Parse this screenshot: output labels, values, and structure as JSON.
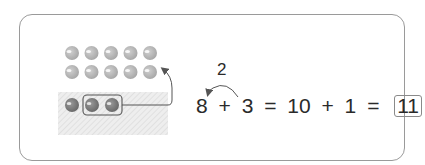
{
  "diagram": {
    "ten_frame": {
      "rows": 2,
      "columns": 5,
      "ball_count": 10,
      "ball_color": "#b4b4b4"
    },
    "extra_row": {
      "ball_count": 3,
      "grouped_ball_count": 2,
      "ball_color": "#7a7a7a"
    },
    "equation": {
      "term1": "8",
      "op1": "+",
      "term2": "3",
      "eq1": "=",
      "term3": "10",
      "op2": "+",
      "term4": "1",
      "eq2": "=",
      "answer": "11"
    },
    "carry_label": "2"
  }
}
